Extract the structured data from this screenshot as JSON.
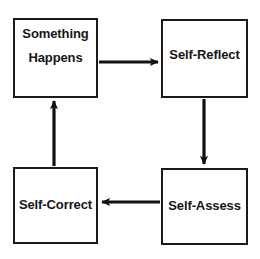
{
  "diagram": {
    "type": "cycle-flowchart",
    "title": "",
    "background_color": "#ffffff",
    "stroke_color": "#1a1a1a",
    "text_color": "#151515",
    "nodes": [
      {
        "id": "something-happens",
        "label_line_1": "Something",
        "label_line_2": "Happens",
        "position": "top-left"
      },
      {
        "id": "self-reflect",
        "label": "Self-Reflect",
        "position": "top-right"
      },
      {
        "id": "self-assess",
        "label": "Self-Assess",
        "position": "bottom-right"
      },
      {
        "id": "self-correct",
        "label": "Self-Correct",
        "position": "bottom-left"
      }
    ],
    "edges": [
      {
        "id": "edge-happens-to-reflect",
        "from": "something-happens",
        "to": "self-reflect",
        "direction": "right"
      },
      {
        "id": "edge-reflect-to-assess",
        "from": "self-reflect",
        "to": "self-assess",
        "direction": "down"
      },
      {
        "id": "edge-assess-to-correct",
        "from": "self-assess",
        "to": "self-correct",
        "direction": "left"
      },
      {
        "id": "edge-correct-to-happens",
        "from": "self-correct",
        "to": "something-happens",
        "direction": "up"
      }
    ]
  }
}
